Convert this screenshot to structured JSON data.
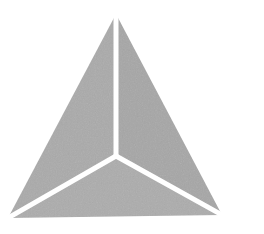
{
  "canvas": {
    "width": 264,
    "height": 234,
    "background_color": "#ffffff",
    "title": "Triangle Mark"
  },
  "graphic": {
    "name": "segmented-triangle-logo",
    "description": "Gray equilateral-style triangle split by three white radial gaps into three facets, resembling a pyramid or tetrahedron viewed from above",
    "fill_color": "#a8a8a8",
    "fill_color_light": "#b4b4b4",
    "fill_color_dark": "#9d9d9d",
    "gap_color": "#ffffff",
    "gap_width_px": 5,
    "texture": "fine noise dither",
    "vertices": {
      "apex": {
        "x": 116,
        "y": 14
      },
      "bottom_left": {
        "x": 8,
        "y": 218
      },
      "bottom_right": {
        "x": 222,
        "y": 215
      }
    },
    "center_junction": {
      "x": 116,
      "y": 156
    },
    "facets": [
      {
        "name": "left-facet",
        "points": "116,14 8,218 116,156",
        "fill": "#aaaaaa"
      },
      {
        "name": "right-facet",
        "points": "116,14 116,156 222,215",
        "fill": "#a6a6a6"
      },
      {
        "name": "bottom-facet",
        "points": "116,156 8,218 222,215",
        "fill": "#acacac"
      }
    ],
    "gaps": [
      {
        "name": "gap-to-apex",
        "x1": 116,
        "y1": 156,
        "x2": 116,
        "y2": 14
      },
      {
        "name": "gap-to-bottom-left",
        "x1": 116,
        "y1": 156,
        "x2": 8,
        "y2": 218
      },
      {
        "name": "gap-to-bottom-right",
        "x1": 116,
        "y1": 156,
        "x2": 222,
        "y2": 215
      }
    ]
  }
}
